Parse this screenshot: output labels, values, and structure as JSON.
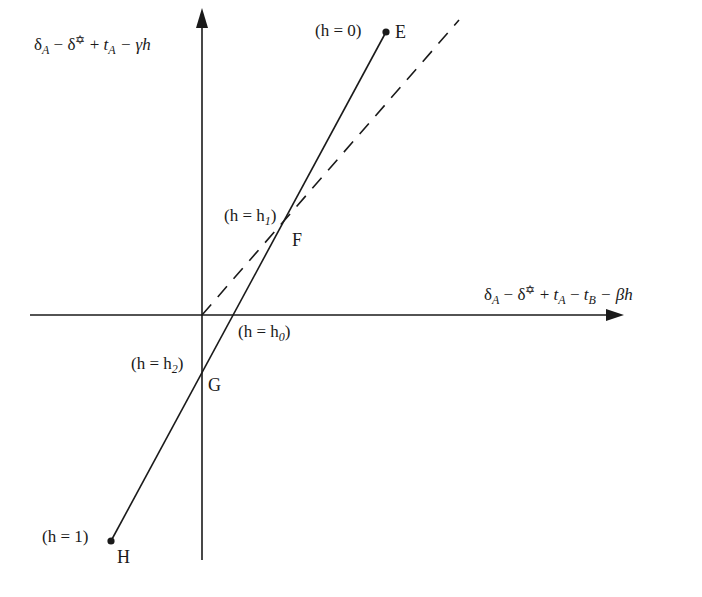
{
  "diagram": {
    "y_axis_label": {
      "parts": [
        "δ",
        "A",
        " − δ",
        "✡",
        " + ",
        "t",
        "A",
        " − γh"
      ],
      "text": "δ_A − δ* + t_A − γh"
    },
    "x_axis_label": {
      "parts": [
        "δ",
        "A",
        " − δ",
        "✡",
        " + ",
        "t",
        "A",
        " − ",
        "t",
        "B",
        " − βh"
      ],
      "text": "δ_A − δ* + t_A − t_B − βh"
    },
    "points": [
      {
        "id": "E",
        "name": "E",
        "condition": "(h = 0)",
        "h_sub": "",
        "x": 386,
        "y": 32
      },
      {
        "id": "F",
        "name": "F",
        "condition": "(h = h",
        "h_sub": "1",
        "x": 288,
        "y": 224
      },
      {
        "id": "G",
        "name": "G",
        "condition": "(h = h",
        "h_sub": "2",
        "x": 202,
        "y": 382
      },
      {
        "id": "H",
        "name": "H",
        "condition": "(h = 1)",
        "h_sub": "",
        "x": 111,
        "y": 541
      }
    ],
    "x_intercept": {
      "condition": "(h = h",
      "h_sub": "0",
      "x": 238,
      "y": 315
    },
    "solid_line": {
      "from": [
        111,
        541
      ],
      "to": [
        386,
        32
      ],
      "style": "solid"
    },
    "dashed_line": {
      "from": [
        202,
        315
      ],
      "to": [
        459,
        20
      ],
      "style": "dashed"
    },
    "axes": {
      "origin": [
        202,
        315
      ],
      "x_range": [
        30,
        623
      ],
      "y_range": [
        10,
        560
      ]
    },
    "colors": {
      "ink": "#1a1a1a",
      "background": "#ffffff"
    }
  }
}
